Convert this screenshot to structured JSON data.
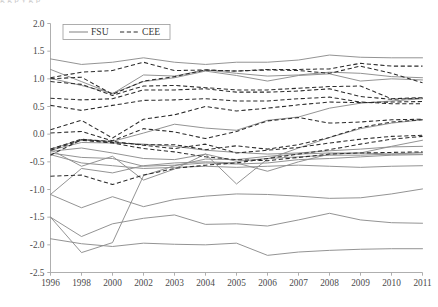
{
  "figure": {
    "caption_sliver": "g                 g            p y        g            p"
  },
  "chart_data": {
    "type": "line",
    "title": "",
    "subtitle": "",
    "xlabel": "",
    "ylabel": "",
    "grid": false,
    "legend_position": "top-left",
    "categories": [
      "1996",
      "1998",
      "2000",
      "2002",
      "2003",
      "2004",
      "2005",
      "2006",
      "2007",
      "2008",
      "2009",
      "2010",
      "2011"
    ],
    "xtick_labels": [
      "1996",
      "1998",
      "2000",
      "2002",
      "2003",
      "2004",
      "2005",
      "2006",
      "2007",
      "2008",
      "2009",
      "2010",
      "2011"
    ],
    "ytick_labels": [
      "2.0",
      "1.5",
      "1.0",
      "0.5",
      "0.0",
      "-0.5",
      "-1.0",
      "-1.5",
      "-2.0",
      "-2.5"
    ],
    "ylim": [
      -2.5,
      2.0
    ],
    "ytick_step": 0.5,
    "legend": [
      {
        "name": "FSU",
        "style": "solid",
        "color": "#8d8d8d"
      },
      {
        "name": "CEE",
        "style": "dashed",
        "color": "#2b2b2b"
      }
    ],
    "series": [
      {
        "name": "FSU-1",
        "group": "FSU",
        "style": "solid",
        "color": "#8d8d8d",
        "values": [
          1.36,
          1.26,
          1.3,
          1.38,
          1.3,
          1.26,
          1.3,
          1.3,
          1.34,
          1.43,
          1.39,
          1.38,
          1.38
        ]
      },
      {
        "name": "FSU-2",
        "group": "FSU",
        "style": "solid",
        "color": "#8d8d8d",
        "values": [
          1.17,
          0.95,
          0.73,
          1.07,
          1.05,
          1.16,
          1.1,
          1.05,
          1.07,
          1.12,
          1.1,
          1.04,
          1.02
        ]
      },
      {
        "name": "FSU-3",
        "group": "FSU",
        "style": "solid",
        "color": "#8d8d8d",
        "values": [
          1.01,
          0.88,
          0.74,
          0.95,
          1.02,
          1.14,
          1.06,
          0.96,
          1.06,
          1.09,
          0.96,
          1.0,
          0.98
        ]
      },
      {
        "name": "FSU-4",
        "group": "FSU",
        "style": "solid",
        "color": "#8d8d8d",
        "values": [
          -0.27,
          -0.1,
          -0.13,
          0.02,
          0.18,
          0.11,
          0.07,
          0.25,
          0.31,
          0.47,
          0.56,
          0.6,
          0.64
        ]
      },
      {
        "name": "FSU-5",
        "group": "FSU",
        "style": "solid",
        "color": "#8d8d8d",
        "values": [
          -0.29,
          -0.15,
          -0.16,
          -0.18,
          -0.22,
          -0.29,
          -0.33,
          -0.36,
          -0.34,
          -0.3,
          -0.27,
          -0.23,
          -0.22
        ]
      },
      {
        "name": "FSU-6",
        "group": "FSU",
        "style": "solid",
        "color": "#8d8d8d",
        "values": [
          -0.31,
          -0.25,
          -0.34,
          -0.44,
          -0.46,
          -0.36,
          -0.49,
          -0.44,
          -0.41,
          -0.38,
          -0.38,
          -0.36,
          -0.33
        ]
      },
      {
        "name": "FSU-7",
        "group": "FSU",
        "style": "solid",
        "color": "#8d8d8d",
        "values": [
          -0.34,
          -0.42,
          -0.44,
          -0.58,
          -0.56,
          -0.52,
          -0.54,
          -0.52,
          -0.46,
          -0.44,
          -0.41,
          -0.38,
          -0.37
        ]
      },
      {
        "name": "FSU-8",
        "group": "FSU",
        "style": "solid",
        "color": "#8d8d8d",
        "values": [
          -0.37,
          -0.52,
          -0.57,
          -0.62,
          -0.6,
          -0.58,
          -0.6,
          -0.58,
          -0.56,
          -0.58,
          -0.6,
          -0.58,
          -0.57
        ]
      },
      {
        "name": "FSU-9",
        "group": "FSU",
        "style": "solid",
        "color": "#8d8d8d",
        "values": [
          -0.28,
          -0.58,
          -0.4,
          -0.83,
          -0.63,
          -0.36,
          -0.9,
          -0.45,
          -0.25,
          -0.06,
          0.1,
          0.2,
          0.26
        ]
      },
      {
        "name": "FSU-10",
        "group": "FSU",
        "style": "solid",
        "color": "#8d8d8d",
        "values": [
          -1.09,
          -1.33,
          -1.13,
          -1.31,
          -1.18,
          -1.12,
          -1.08,
          -1.09,
          -1.12,
          -1.16,
          -1.15,
          -1.08,
          -0.99
        ]
      },
      {
        "name": "FSU-11",
        "group": "FSU",
        "style": "solid",
        "color": "#8d8d8d",
        "values": [
          -1.5,
          -1.85,
          -1.62,
          -1.52,
          -1.46,
          -1.63,
          -1.62,
          -1.66,
          -1.55,
          -1.43,
          -1.55,
          -1.6,
          -1.61
        ]
      },
      {
        "name": "FSU-12",
        "group": "FSU",
        "style": "solid",
        "color": "#8d8d8d",
        "values": [
          -1.89,
          -1.98,
          -2.03,
          -1.97,
          -1.99,
          -2.0,
          -1.97,
          -2.19,
          -2.13,
          -2.1,
          -2.08,
          -2.07,
          -2.07
        ]
      },
      {
        "name": "FSU-13",
        "group": "FSU",
        "style": "solid",
        "color": "#8d8d8d",
        "values": [
          -1.5,
          -2.14,
          -1.96,
          -0.75,
          -0.57,
          -0.45,
          -0.46,
          -0.4,
          -0.36,
          -0.34,
          -0.34,
          -0.22,
          -0.11
        ]
      },
      {
        "name": "FSU-14",
        "group": "FSU",
        "style": "solid",
        "color": "#8d8d8d",
        "values": [
          -1.09,
          -0.62,
          -0.7,
          -0.57,
          -0.52,
          -0.5,
          -0.52,
          -0.67,
          -0.5,
          -0.36,
          -0.34,
          -0.36,
          -0.36
        ]
      },
      {
        "name": "CEE-1",
        "group": "CEE",
        "style": "dashed",
        "color": "#2b2b2b",
        "values": [
          1.02,
          1.12,
          1.15,
          1.3,
          1.15,
          1.16,
          1.14,
          1.17,
          1.17,
          1.18,
          1.28,
          1.23,
          1.23
        ]
      },
      {
        "name": "CEE-2",
        "group": "CEE",
        "style": "dashed",
        "color": "#2b2b2b",
        "values": [
          1.0,
          1.03,
          0.72,
          0.96,
          1.04,
          1.16,
          1.14,
          1.16,
          1.15,
          1.1,
          1.23,
          1.1,
          0.93
        ]
      },
      {
        "name": "CEE-3",
        "group": "CEE",
        "style": "dashed",
        "color": "#2b2b2b",
        "values": [
          0.95,
          0.9,
          0.7,
          0.87,
          0.88,
          0.84,
          0.8,
          0.8,
          0.83,
          0.86,
          0.87,
          0.64,
          0.66
        ]
      },
      {
        "name": "CEE-4",
        "group": "CEE",
        "style": "dashed",
        "color": "#2b2b2b",
        "values": [
          0.65,
          0.62,
          0.64,
          0.8,
          0.8,
          0.82,
          0.76,
          0.76,
          0.78,
          0.82,
          0.68,
          0.63,
          0.65
        ]
      },
      {
        "name": "CEE-5",
        "group": "CEE",
        "style": "dashed",
        "color": "#2b2b2b",
        "values": [
          0.52,
          0.43,
          0.52,
          0.61,
          0.62,
          0.64,
          0.6,
          0.6,
          0.64,
          0.67,
          0.58,
          0.55,
          0.55
        ]
      },
      {
        "name": "CEE-6",
        "group": "CEE",
        "style": "dashed",
        "color": "#2b2b2b",
        "values": [
          0.08,
          0.25,
          -0.07,
          0.27,
          0.35,
          0.5,
          0.42,
          0.47,
          0.53,
          0.58,
          0.57,
          0.58,
          0.59
        ]
      },
      {
        "name": "CEE-7",
        "group": "CEE",
        "style": "dashed",
        "color": "#2b2b2b",
        "values": [
          0.02,
          0.05,
          -0.12,
          0.1,
          0.04,
          -0.08,
          0.05,
          0.24,
          0.3,
          0.2,
          0.22,
          0.26,
          0.27
        ]
      },
      {
        "name": "CEE-8",
        "group": "CEE",
        "style": "dashed",
        "color": "#2b2b2b",
        "values": [
          -0.27,
          -0.09,
          -0.15,
          -0.19,
          -0.19,
          -0.28,
          -0.21,
          -0.27,
          -0.19,
          -0.06,
          0.12,
          0.22,
          0.26
        ]
      },
      {
        "name": "CEE-9",
        "group": "CEE",
        "style": "dashed",
        "color": "#2b2b2b",
        "values": [
          -0.38,
          -0.1,
          -0.13,
          -0.2,
          -0.26,
          -0.18,
          -0.34,
          -0.29,
          -0.24,
          -0.16,
          -0.09,
          -0.04,
          -0.02
        ]
      },
      {
        "name": "CEE-10",
        "group": "CEE",
        "style": "dashed",
        "color": "#2b2b2b",
        "values": [
          -0.29,
          -0.11,
          -0.16,
          -0.26,
          -0.32,
          -0.41,
          -0.46,
          -0.48,
          -0.42,
          -0.36,
          -0.34,
          -0.33,
          -0.32
        ]
      },
      {
        "name": "CEE-11",
        "group": "CEE",
        "style": "dashed",
        "color": "#2b2b2b",
        "values": [
          -0.76,
          -0.74,
          -0.91,
          -0.74,
          -0.62,
          -0.56,
          -0.52,
          -0.44,
          -0.36,
          -0.28,
          -0.18,
          -0.09,
          -0.04
        ]
      }
    ]
  }
}
